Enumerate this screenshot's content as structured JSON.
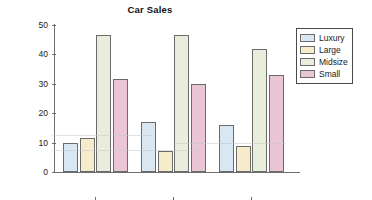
{
  "chart_data": {
    "type": "bar",
    "title": "Car Sales",
    "xlabel": "",
    "ylabel": "Percentage",
    "categories": [
      "1985",
      "2000",
      "2007"
    ],
    "series": [
      {
        "name": "Luxury",
        "color": "#d8e7f2",
        "values": [
          10,
          17,
          16
        ]
      },
      {
        "name": "Large",
        "color": "#f6eccc",
        "values": [
          11.7,
          7,
          9
        ]
      },
      {
        "name": "Midsize",
        "color": "#e8eedb",
        "values": [
          46.5,
          46.5,
          42
        ]
      },
      {
        "name": "Small",
        "color": "#e9c5d6",
        "values": [
          31.5,
          30,
          33
        ]
      }
    ],
    "ylim": [
      0,
      50
    ],
    "yticks": [
      "0",
      "10",
      "20",
      "30",
      "40",
      "50"
    ],
    "grid": false,
    "legend_position": "right"
  },
  "legend": {
    "items": [
      {
        "label": "Luxury"
      },
      {
        "label": "Large"
      },
      {
        "label": "Midsize"
      },
      {
        "label": "Small"
      }
    ]
  }
}
